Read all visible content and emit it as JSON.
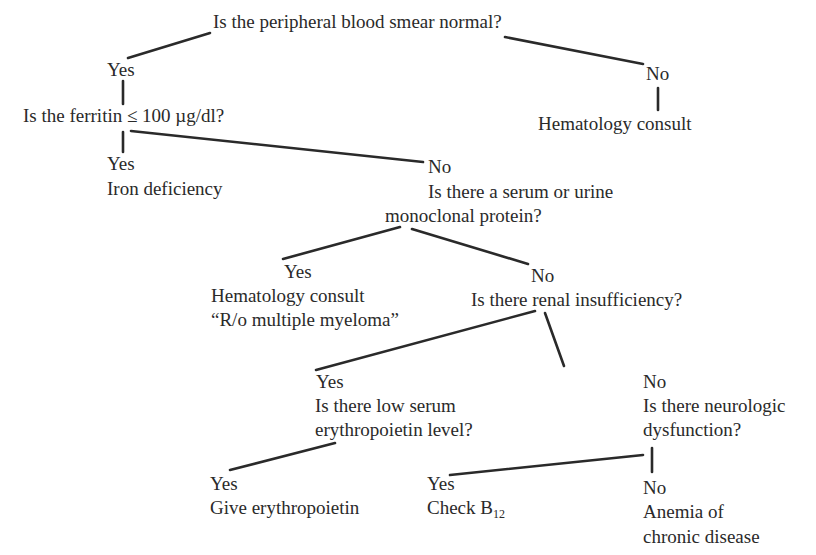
{
  "diagram": {
    "type": "decision-tree",
    "root": {
      "question": "Is the peripheral blood smear normal?",
      "yes": {
        "label": "Yes",
        "question": "Is the ferritin ≤ 100 µg/dl?",
        "yes": {
          "label": "Yes",
          "result": "Iron deficiency"
        },
        "no": {
          "label": "No",
          "question_line1": "Is there a serum or urine",
          "question_line2": "monoclonal protein?",
          "yes": {
            "label": "Yes",
            "result_line1": "Hematology consult",
            "result_line2": "“R/o multiple myeloma”"
          },
          "no": {
            "label": "No",
            "question": "Is there renal insufficiency?",
            "yes": {
              "label": "Yes",
              "question_line1": "Is there low serum",
              "question_line2": "erythropoietin level?",
              "yes": {
                "label": "Yes",
                "result": "Give erythropoietin"
              }
            },
            "no": {
              "label": "No",
              "question_line1": "Is there neurologic",
              "question_line2": "dysfunction?",
              "yes": {
                "label": "Yes",
                "result_prefix": "Check B",
                "result_sub": "12"
              },
              "no": {
                "label": "No",
                "result_line1": "Anemia of",
                "result_line2": "chronic disease"
              }
            }
          }
        }
      },
      "no": {
        "label": "No",
        "result": "Hematology consult"
      }
    }
  }
}
